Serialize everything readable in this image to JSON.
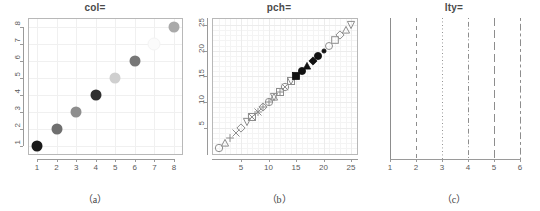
{
  "figure": {
    "panels": [
      {
        "id": "a",
        "title": "col=",
        "caption": "（a）"
      },
      {
        "id": "b",
        "title": "pch=",
        "caption": "（b）"
      },
      {
        "id": "c",
        "title": "lty=",
        "caption": "（c）"
      }
    ]
  },
  "chart_data": [
    {
      "type": "scatter",
      "title": "col=",
      "caption": "（a）",
      "xlabel": "",
      "ylabel": "",
      "xlim": [
        1,
        8
      ],
      "ylim": [
        1,
        8
      ],
      "xticks": [
        1,
        2,
        3,
        4,
        5,
        6,
        7,
        8
      ],
      "yticks": [
        1,
        2,
        3,
        4,
        5,
        6,
        7,
        8
      ],
      "grid": true,
      "legend": "none",
      "marker": "filled-circle",
      "x": [
        1,
        2,
        3,
        4,
        5,
        6,
        7,
        8
      ],
      "y": [
        1,
        2,
        3,
        4,
        5,
        6,
        7,
        8
      ],
      "point_colors": [
        "#1a1a1a",
        "#6f6f6f",
        "#8e8e8e",
        "#303030",
        "#cfcfcf",
        "#777777",
        "#fbfbfb",
        "#a9a9a9"
      ],
      "point_size_px": 11
    },
    {
      "type": "scatter",
      "title": "pch=",
      "caption": "（b）",
      "xlabel": "",
      "ylabel": "",
      "xlim": [
        1,
        25
      ],
      "ylim": [
        1,
        25
      ],
      "xticks": [
        5,
        10,
        15,
        20,
        25
      ],
      "yticks": [
        5,
        10,
        15,
        20,
        25
      ],
      "grid": true,
      "legend": "none",
      "x": [
        1,
        2,
        3,
        4,
        5,
        6,
        7,
        8,
        9,
        10,
        11,
        12,
        13,
        14,
        15,
        16,
        17,
        18,
        19,
        20,
        21,
        22,
        23,
        24,
        25
      ],
      "y": [
        1,
        2,
        3,
        4,
        5,
        6,
        7,
        8,
        9,
        10,
        11,
        12,
        13,
        14,
        15,
        16,
        17,
        18,
        19,
        20,
        21,
        22,
        23,
        24,
        25
      ],
      "markers": [
        "circle-open",
        "triangle-up-open",
        "plus",
        "cross-x",
        "diamond-open",
        "triangle-down-open",
        "square-x",
        "asterisk",
        "diamond-plus",
        "circle-plus",
        "star-open",
        "square-plus",
        "circle-x",
        "square-triangle",
        "filled-square",
        "filled-circle",
        "filled-triangle-up",
        "filled-diamond",
        "filled-circle-solid",
        "filled-dot",
        "circle-fill-open",
        "circle-open-2",
        "square-open-2",
        "diamond-open-2",
        "triangle-down-open-2"
      ],
      "outline_color": "#8d8d8d",
      "fill_color": "#111111"
    },
    {
      "type": "line",
      "title": "lty=",
      "caption": "（c）",
      "xlabel": "",
      "ylabel": "",
      "xlim": [
        1,
        6
      ],
      "xticks": [
        1,
        2,
        3,
        4,
        5,
        6
      ],
      "yticks": [],
      "grid": false,
      "legend": "none",
      "line_color": "#8d8d8d",
      "lines": [
        {
          "lty": 1,
          "x": 1,
          "style": "solid"
        },
        {
          "lty": 2,
          "x": 2,
          "style": "dashed"
        },
        {
          "lty": 3,
          "x": 3,
          "style": "dotted"
        },
        {
          "lty": 4,
          "x": 4,
          "style": "dotdash"
        },
        {
          "lty": 5,
          "x": 5,
          "style": "longdash"
        },
        {
          "lty": 6,
          "x": 6,
          "style": "twodash"
        }
      ]
    }
  ]
}
